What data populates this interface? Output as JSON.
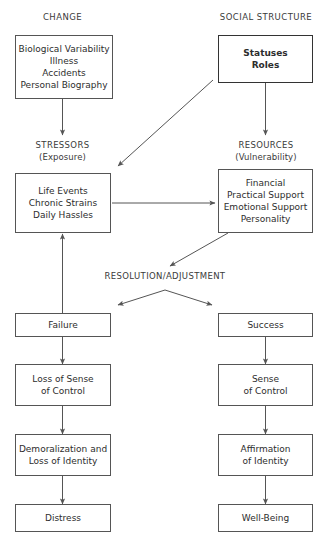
{
  "diagram": {
    "column_headers": [
      {
        "id": "change",
        "label": "CHANGE"
      },
      {
        "id": "social-structure",
        "label": "SOCIAL STRUCTURE"
      }
    ],
    "stage_labels": [
      {
        "id": "stressors",
        "main": "STRESSORS",
        "sub": "(Exposure)"
      },
      {
        "id": "resources",
        "main": "RESOURCES",
        "sub": "(Vulnerability)"
      },
      {
        "id": "resolution",
        "main": "RESOLUTION/ADJUSTMENT",
        "sub": ""
      }
    ],
    "nodes": [
      {
        "id": "change-sources",
        "lines": [
          "Biological Variability",
          "Illness",
          "Accidents",
          "Personal Biography"
        ],
        "bold": false
      },
      {
        "id": "statuses-roles",
        "lines": [
          "Statuses",
          "Roles"
        ],
        "bold": true
      },
      {
        "id": "stressors-list",
        "lines": [
          "Life Events",
          "Chronic Strains",
          "Daily Hassles"
        ],
        "bold": false
      },
      {
        "id": "resources-list",
        "lines": [
          "Financial",
          "Practical Support",
          "Emotional Support",
          "Personality"
        ],
        "bold": false
      },
      {
        "id": "failure",
        "lines": [
          "Failure"
        ],
        "bold": false
      },
      {
        "id": "success",
        "lines": [
          "Success"
        ],
        "bold": false
      },
      {
        "id": "loss-of-sense-of-control",
        "lines": [
          "Loss of Sense",
          "of Control"
        ],
        "bold": false
      },
      {
        "id": "sense-of-control",
        "lines": [
          "Sense",
          "of Control"
        ],
        "bold": false
      },
      {
        "id": "demoralization",
        "lines": [
          "Demoralization and",
          "Loss of Identity"
        ],
        "bold": false
      },
      {
        "id": "affirmation",
        "lines": [
          "Affirmation",
          "of Identity"
        ],
        "bold": false
      },
      {
        "id": "distress",
        "lines": [
          "Distress"
        ],
        "bold": false
      },
      {
        "id": "well-being",
        "lines": [
          "Well-Being"
        ],
        "bold": false
      }
    ],
    "colors": {
      "box_border": "#555555",
      "strong_border": "#333333",
      "text": "#2d2d2d",
      "label_text": "#3a3a3a",
      "arrow": "#555555",
      "background": "#ffffff"
    }
  }
}
